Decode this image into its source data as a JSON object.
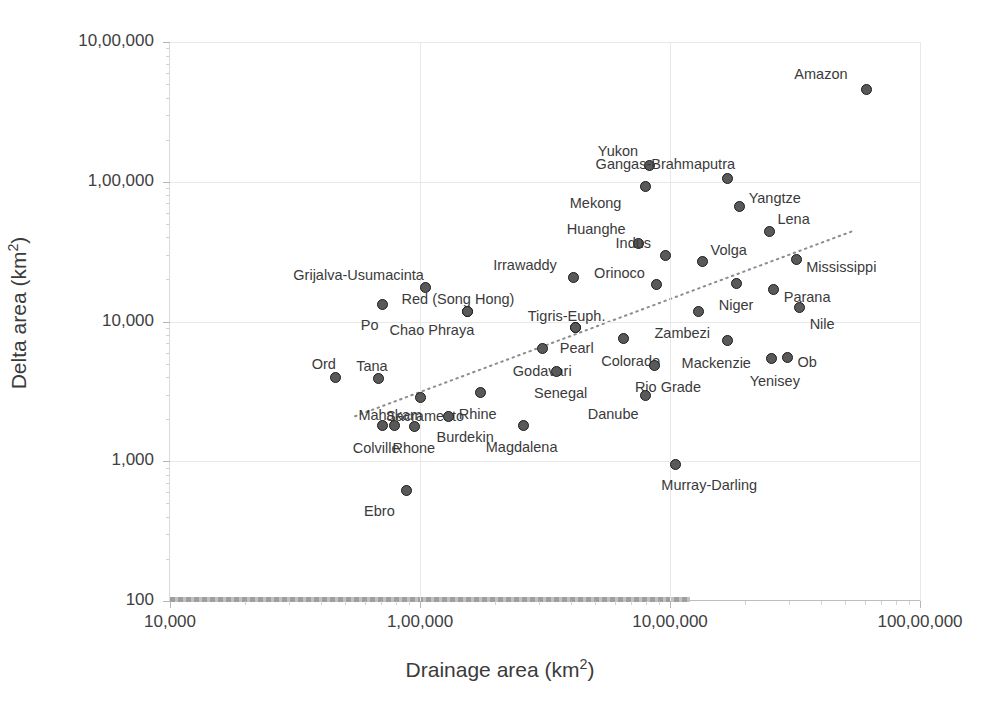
{
  "chart_data": {
    "type": "scatter",
    "title": "",
    "xlabel": "Drainage area (km2)",
    "ylabel": "Delta area (km2)",
    "xscale": "log",
    "yscale": "log",
    "xlim": [
      10000,
      10000000
    ],
    "ylim": [
      100,
      1000000
    ],
    "grid": true,
    "legend": "none",
    "x_ticks": [
      "10,000",
      "1,00,000",
      "10,00,000",
      "100,00,000"
    ],
    "x_tick_values": [
      10000,
      100000,
      1000000,
      10000000
    ],
    "y_ticks": [
      "100",
      "1,000",
      "10,000",
      "1,00,000",
      "10,00,000"
    ],
    "y_tick_values": [
      100,
      1000,
      10000,
      100000,
      1000000
    ],
    "trendline": {
      "style": "dotted",
      "color": "#8d8d8d",
      "x_start": 55000,
      "y_start": 2100,
      "x_end": 5500000,
      "y_end": 45000
    },
    "points": [
      {
        "label": "Amazon",
        "x": 6100000,
        "y": 460000,
        "lx": -72,
        "ly": -22
      },
      {
        "label": "Yukon",
        "x": 830000,
        "y": 130000,
        "lx": -52,
        "ly": -22
      },
      {
        "label": "Gangas-Brahmaputra",
        "x": 1700000,
        "y": 105000,
        "lx": -132,
        "ly": -22
      },
      {
        "label": "Mekong",
        "x": 800000,
        "y": 93000,
        "lx": -76,
        "ly": 10
      },
      {
        "label": "Yangtze",
        "x": 1900000,
        "y": 66000,
        "lx": 9,
        "ly": -16
      },
      {
        "label": "Lena",
        "x": 2500000,
        "y": 44000,
        "lx": 8,
        "ly": -20
      },
      {
        "label": "Huanghe",
        "x": 750000,
        "y": 36000,
        "lx": -72,
        "ly": -22
      },
      {
        "label": "Indus",
        "x": 960000,
        "y": 29500,
        "lx": -50,
        "ly": -20
      },
      {
        "label": "Volga",
        "x": 1350000,
        "y": 27000,
        "lx": 8,
        "ly": -18
      },
      {
        "label": "Mississippi",
        "x": 3200000,
        "y": 28000,
        "lx": 10,
        "ly": 1
      },
      {
        "label": "Irrawaddy",
        "x": 410000,
        "y": 20500,
        "lx": -80,
        "ly": -20
      },
      {
        "label": "Orinoco",
        "x": 880000,
        "y": 18500,
        "lx": -62,
        "ly": -18
      },
      {
        "label": "Grijalva-Usumacinta",
        "x": 105000,
        "y": 17500,
        "lx": -132,
        "ly": -20
      },
      {
        "label": "Niger",
        "x": 1850000,
        "y": 18800,
        "lx": -18,
        "ly": 15
      },
      {
        "label": "Parana",
        "x": 2600000,
        "y": 17000,
        "lx": 10,
        "ly": 1
      },
      {
        "label": "Po",
        "x": 71000,
        "y": 13300,
        "lx": -22,
        "ly": 14
      },
      {
        "label": "Red (Song Hong)",
        "x": 155000,
        "y": 11800,
        "lx": -66,
        "ly": -19
      },
      {
        "label": "Zambezi",
        "x": 1300000,
        "y": 11800,
        "lx": -44,
        "ly": 15
      },
      {
        "label": "Nile",
        "x": 3300000,
        "y": 12500,
        "lx": 10,
        "ly": 9
      },
      {
        "label": "Chao Phraya",
        "x": 155000,
        "y": 11800,
        "lx": -78,
        "ly": 12
      },
      {
        "label": "Tigris-Euph.",
        "x": 420000,
        "y": 9100,
        "lx": -48,
        "ly": -18
      },
      {
        "label": "Pearl",
        "x": 420000,
        "y": 9100,
        "lx": -16,
        "ly": 14
      },
      {
        "label": "Colorado",
        "x": 650000,
        "y": 7500,
        "lx": -22,
        "ly": 15
      },
      {
        "label": "Mackenzie",
        "x": 1700000,
        "y": 7300,
        "lx": -46,
        "ly": 15
      },
      {
        "label": "Godavari",
        "x": 310000,
        "y": 6400,
        "lx": -30,
        "ly": 15
      },
      {
        "label": "Ob",
        "x": 2950000,
        "y": 5500,
        "lx": 10,
        "ly": -3
      },
      {
        "label": "Yenisey",
        "x": 2550000,
        "y": 5400,
        "lx": -22,
        "ly": 15
      },
      {
        "label": "Rio Grade",
        "x": 870000,
        "y": 4850,
        "lx": -20,
        "ly": 15
      },
      {
        "label": "Senegal",
        "x": 350000,
        "y": 4400,
        "lx": -22,
        "ly": 15
      },
      {
        "label": "Ord",
        "x": 46000,
        "y": 4000,
        "lx": -24,
        "ly": -20
      },
      {
        "label": "Tana",
        "x": 68000,
        "y": 3900,
        "lx": -22,
        "ly": -20
      },
      {
        "label": "Rhine",
        "x": 175000,
        "y": 3100,
        "lx": -22,
        "ly": 14
      },
      {
        "label": "Danube",
        "x": 800000,
        "y": 2950,
        "lx": -58,
        "ly": 11
      },
      {
        "label": "Sacramento",
        "x": 100000,
        "y": 2850,
        "lx": -34,
        "ly": 11
      },
      {
        "label": "Magdalena",
        "x": 260000,
        "y": 1800,
        "lx": -38,
        "ly": 14
      },
      {
        "label": "Burdekin",
        "x": 130000,
        "y": 2100,
        "lx": -12,
        "ly": 14
      },
      {
        "label": "Mahakam",
        "x": 79000,
        "y": 1800,
        "lx": -36,
        "ly": -18
      },
      {
        "label": "Colville",
        "x": 71000,
        "y": 1800,
        "lx": -30,
        "ly": 15
      },
      {
        "label": "Rhone",
        "x": 95000,
        "y": 1780,
        "lx": -22,
        "ly": 15
      },
      {
        "label": "Murray-Darling",
        "x": 1050000,
        "y": 950,
        "lx": -14,
        "ly": 14
      },
      {
        "label": "Ebro",
        "x": 88000,
        "y": 620,
        "lx": -42,
        "ly": 14
      }
    ]
  }
}
